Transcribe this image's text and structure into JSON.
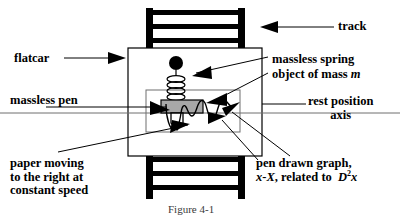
{
  "figure": {
    "caption": "Figure 4-1",
    "labels": {
      "flatcar": "flatcar",
      "track": "track",
      "massless_spring": "massless spring",
      "object_of_mass_prefix": "object of mass ",
      "object_of_mass_symbol": "m",
      "rest_position_line1": "rest position",
      "rest_position_line2": "axis",
      "massless_pen": "massless pen",
      "paper_moving_line1": "paper moving",
      "paper_moving_line2": "to the right at",
      "paper_moving_line3": "constant speed",
      "pen_graph_line1": "pen drawn graph,",
      "pen_graph_x": "x",
      "pen_graph_dash": "-",
      "pen_graph_X": "X",
      "pen_graph_mid": ", related to  ",
      "pen_graph_D": "D",
      "pen_graph_exp": "2",
      "pen_graph_x2": "x"
    },
    "colors": {
      "ink": "#000000",
      "mass_fill": "#a8a8a8",
      "background": "#ffffff",
      "caption_text": "#3a3a3a"
    },
    "parts": {
      "track_top": "track-top",
      "track_bottom": "track-bottom",
      "flatcar_body": "flatcar-body",
      "paper_sheet": "paper-sheet",
      "spring": "massless-spring",
      "anchor": "spring-anchor",
      "mass_block": "object-of-mass-m",
      "pen": "massless-pen",
      "waveform": "pen-drawn-graph",
      "rest_axis": "rest-position-axis"
    }
  }
}
